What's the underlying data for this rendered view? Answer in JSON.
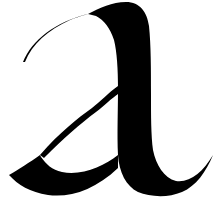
{
  "glyph": {
    "character": "a",
    "style": "calligraphic blackletter lowercase",
    "ink_color": "#000000",
    "background_color": "#ffffff"
  }
}
